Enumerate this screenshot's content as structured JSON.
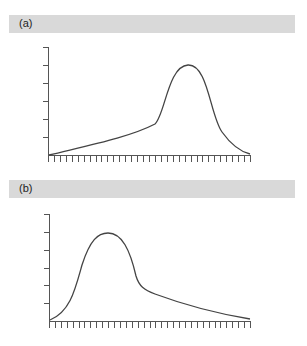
{
  "panels": [
    {
      "label": "(a)"
    },
    {
      "label": "(b)"
    }
  ],
  "chart_data": [
    {
      "type": "line",
      "title": "(a)",
      "xlabel": "",
      "ylabel": "",
      "grid": false,
      "y_ticks": 6,
      "x_ticks": 34,
      "description": "Left-skewed curve: slow gradual rise then sharp peak near right, falling to baseline",
      "x": [
        0,
        0.2,
        0.4,
        0.55,
        0.62,
        0.7,
        0.78,
        0.88,
        1.0
      ],
      "values": [
        0.03,
        0.15,
        0.3,
        0.45,
        0.75,
        1.0,
        0.9,
        0.3,
        0.03
      ],
      "ylim": [
        0,
        1.2
      ]
    },
    {
      "type": "line",
      "title": "(b)",
      "xlabel": "",
      "ylabel": "",
      "grid": false,
      "y_ticks": 6,
      "x_ticks": 34,
      "description": "Right-skewed curve: sharp peak near left, then long gradual tail to baseline",
      "x": [
        0,
        0.12,
        0.22,
        0.3,
        0.38,
        0.45,
        0.6,
        0.8,
        1.0
      ],
      "values": [
        0.03,
        0.3,
        0.9,
        1.0,
        0.75,
        0.45,
        0.3,
        0.15,
        0.03
      ],
      "ylim": [
        0,
        1.2
      ]
    }
  ]
}
